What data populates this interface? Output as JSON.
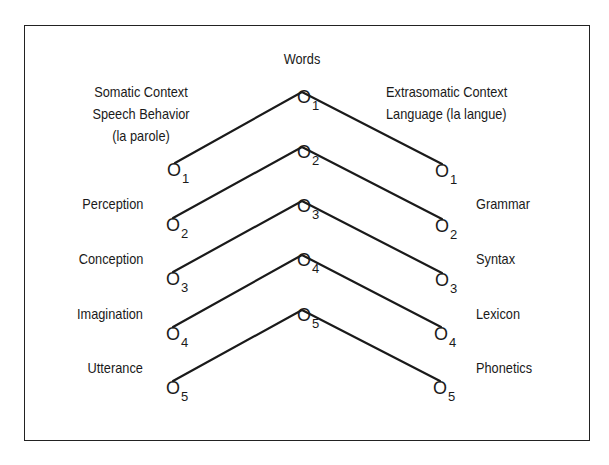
{
  "title": "Words",
  "left_header": {
    "line1": "Somatic  Context",
    "line2": "Speech Behavior",
    "line3": "(la parole)"
  },
  "right_header": {
    "line1": "Extrasomatic Context",
    "line2": "Language (la langue)"
  },
  "left_labels": [
    "Perception",
    "Conception",
    "Imagination",
    "Utterance"
  ],
  "right_labels": [
    "Grammar",
    "Syntax",
    "Lexicon",
    "Phonetics"
  ],
  "node_symbol": "O",
  "levels": [
    {
      "index": "1"
    },
    {
      "index": "2"
    },
    {
      "index": "3"
    },
    {
      "index": "4"
    },
    {
      "index": "5"
    }
  ],
  "colors": {
    "line": "#1a1a1a",
    "text": "#1a1a1a",
    "background": "#ffffff"
  }
}
